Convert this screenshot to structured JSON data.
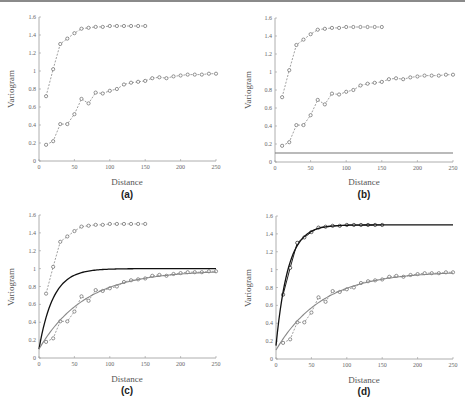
{
  "chart_data": [
    {
      "id": "a",
      "type": "line",
      "panel_label": "(a)",
      "xlabel": "Distance",
      "ylabel": "Variogram",
      "xlim": [
        0,
        250
      ],
      "ylim": [
        0,
        1.6
      ],
      "xticks": [
        0,
        50,
        100,
        150,
        200,
        250
      ],
      "yticks": [
        0,
        0.2,
        0.4,
        0.6,
        0.8,
        1,
        1.2,
        1.4,
        1.6
      ],
      "ytick_labels": [
        "0",
        "0.2",
        "0.4",
        "0.6",
        "0.8",
        "1",
        "1.2",
        "1.4",
        "1.6"
      ],
      "series": [
        {
          "name": "upper-empirical",
          "style": "dashed-markers",
          "x": [
            10,
            20,
            30,
            40,
            50,
            60,
            70,
            80,
            90,
            100,
            110,
            120,
            130,
            140,
            150
          ],
          "y": [
            0.72,
            1.02,
            1.3,
            1.36,
            1.42,
            1.47,
            1.48,
            1.49,
            1.49,
            1.5,
            1.5,
            1.5,
            1.5,
            1.5,
            1.5
          ]
        },
        {
          "name": "lower-empirical",
          "style": "dashed-markers",
          "x": [
            10,
            20,
            30,
            40,
            50,
            60,
            70,
            80,
            90,
            100,
            110,
            120,
            130,
            140,
            150,
            160,
            170,
            180,
            190,
            200,
            210,
            220,
            230,
            240,
            250
          ],
          "y": [
            0.18,
            0.22,
            0.41,
            0.41,
            0.52,
            0.69,
            0.64,
            0.76,
            0.75,
            0.78,
            0.8,
            0.85,
            0.87,
            0.88,
            0.89,
            0.92,
            0.93,
            0.92,
            0.94,
            0.95,
            0.96,
            0.96,
            0.96,
            0.97,
            0.97
          ]
        }
      ]
    },
    {
      "id": "b",
      "type": "line",
      "panel_label": "(b)",
      "xlabel": "Distance",
      "ylabel": "Variogram",
      "xlim": [
        0,
        250
      ],
      "ylim": [
        0,
        1.6
      ],
      "xticks": [
        0,
        50,
        100,
        150,
        200,
        250
      ],
      "yticks": [
        0,
        0.2,
        0.4,
        0.6,
        0.8,
        1,
        1.2,
        1.4,
        1.6
      ],
      "ytick_labels": [
        "0",
        "0.2",
        "0.4",
        "0.6",
        "0.8",
        "1",
        "1.2",
        "1.4",
        "1.6"
      ],
      "series": [
        {
          "name": "upper-empirical",
          "style": "dashed-markers",
          "x": [
            10,
            20,
            30,
            40,
            50,
            60,
            70,
            80,
            90,
            100,
            110,
            120,
            130,
            140,
            150
          ],
          "y": [
            0.72,
            1.02,
            1.3,
            1.36,
            1.42,
            1.47,
            1.48,
            1.49,
            1.49,
            1.5,
            1.5,
            1.5,
            1.5,
            1.5,
            1.5
          ]
        },
        {
          "name": "lower-empirical",
          "style": "dashed-markers",
          "x": [
            10,
            20,
            30,
            40,
            50,
            60,
            70,
            80,
            90,
            100,
            110,
            120,
            130,
            140,
            150,
            160,
            170,
            180,
            190,
            200,
            210,
            220,
            230,
            240,
            250
          ],
          "y": [
            0.18,
            0.22,
            0.41,
            0.41,
            0.52,
            0.69,
            0.64,
            0.76,
            0.75,
            0.78,
            0.8,
            0.85,
            0.87,
            0.88,
            0.89,
            0.92,
            0.93,
            0.92,
            0.94,
            0.95,
            0.96,
            0.96,
            0.96,
            0.97,
            0.97
          ]
        },
        {
          "name": "nugget-line",
          "style": "solid-gray",
          "x": [
            0,
            250
          ],
          "y": [
            0.1,
            0.1
          ]
        }
      ]
    },
    {
      "id": "c",
      "type": "line",
      "panel_label": "(c)",
      "xlabel": "Distance",
      "ylabel": "Variogram",
      "xlim": [
        0,
        250
      ],
      "ylim": [
        0,
        1.6
      ],
      "xticks": [
        0,
        50,
        100,
        150,
        200,
        250
      ],
      "yticks": [
        0,
        0.2,
        0.4,
        0.6,
        0.8,
        1,
        1.2,
        1.4,
        1.6
      ],
      "ytick_labels": [
        "0",
        "0.2",
        "0.4",
        "0.6",
        "0.8",
        "1",
        "1.2",
        "1.4",
        "1.6"
      ],
      "series": [
        {
          "name": "upper-empirical",
          "style": "dashed-markers",
          "x": [
            10,
            20,
            30,
            40,
            50,
            60,
            70,
            80,
            90,
            100,
            110,
            120,
            130,
            140,
            150
          ],
          "y": [
            0.72,
            1.02,
            1.3,
            1.36,
            1.42,
            1.47,
            1.48,
            1.49,
            1.49,
            1.5,
            1.5,
            1.5,
            1.5,
            1.5,
            1.5
          ]
        },
        {
          "name": "lower-empirical",
          "style": "dashed-markers",
          "x": [
            10,
            20,
            30,
            40,
            50,
            60,
            70,
            80,
            90,
            100,
            110,
            120,
            130,
            140,
            150,
            160,
            170,
            180,
            190,
            200,
            210,
            220,
            230,
            240,
            250
          ],
          "y": [
            0.18,
            0.22,
            0.41,
            0.41,
            0.52,
            0.69,
            0.64,
            0.76,
            0.75,
            0.78,
            0.8,
            0.85,
            0.87,
            0.88,
            0.89,
            0.92,
            0.93,
            0.92,
            0.94,
            0.95,
            0.96,
            0.96,
            0.96,
            0.97,
            0.97
          ]
        },
        {
          "name": "model-black",
          "style": "solid-black",
          "model": {
            "nugget": 0.1,
            "sill": 1.0,
            "range": 20
          }
        },
        {
          "name": "model-gray",
          "style": "solid-gray",
          "model": {
            "nugget": 0.1,
            "sill": 0.98,
            "range": 65
          }
        }
      ]
    },
    {
      "id": "d",
      "type": "line",
      "panel_label": "(d)",
      "xlabel": "Distance",
      "ylabel": "Variogram",
      "xlim": [
        0,
        250
      ],
      "ylim": [
        0,
        1.6
      ],
      "xticks": [
        0,
        50,
        100,
        150,
        200,
        250
      ],
      "yticks": [
        0,
        0.2,
        0.4,
        0.6,
        0.8,
        1,
        1.2,
        1.4,
        1.6
      ],
      "ytick_labels": [
        "0",
        "0.2",
        "0.4",
        "0.6",
        "0.8",
        "1",
        "1.2",
        "1.4",
        "1.6"
      ],
      "series": [
        {
          "name": "upper-empirical",
          "style": "solid-markers",
          "x": [
            10,
            20,
            30,
            40,
            50,
            60,
            70,
            80,
            90,
            100,
            110,
            120,
            130,
            140,
            150
          ],
          "y": [
            0.72,
            1.02,
            1.3,
            1.36,
            1.42,
            1.47,
            1.48,
            1.49,
            1.49,
            1.5,
            1.5,
            1.5,
            1.5,
            1.5,
            1.5
          ]
        },
        {
          "name": "lower-empirical",
          "style": "dashed-markers",
          "x": [
            10,
            20,
            30,
            40,
            50,
            60,
            70,
            80,
            90,
            100,
            110,
            120,
            130,
            140,
            150,
            160,
            170,
            180,
            190,
            200,
            210,
            220,
            230,
            240,
            250
          ],
          "y": [
            0.18,
            0.22,
            0.41,
            0.41,
            0.52,
            0.69,
            0.64,
            0.76,
            0.75,
            0.78,
            0.8,
            0.85,
            0.87,
            0.88,
            0.89,
            0.92,
            0.93,
            0.92,
            0.94,
            0.95,
            0.96,
            0.96,
            0.96,
            0.97,
            0.97
          ]
        },
        {
          "name": "model-black",
          "style": "solid-black",
          "model": {
            "nugget": 0.15,
            "sill": 1.5,
            "range": 17
          }
        },
        {
          "name": "model-gray",
          "style": "solid-gray",
          "model": {
            "nugget": 0.1,
            "sill": 0.98,
            "range": 65
          }
        }
      ]
    }
  ]
}
